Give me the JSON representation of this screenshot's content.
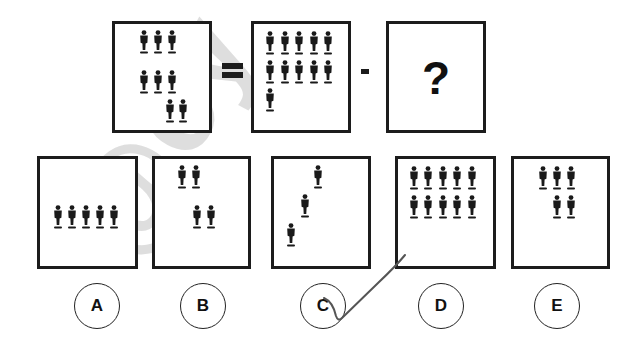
{
  "puzzle": {
    "equation": {
      "left_box": {
        "figure_count": 8,
        "rows": [
          3,
          3,
          2
        ]
      },
      "equals_sign": "=",
      "middle_box": {
        "figure_count": 11,
        "rows": [
          5,
          5,
          1
        ]
      },
      "minus_sign": "-",
      "unknown_box": {
        "label": "?"
      }
    },
    "options": [
      {
        "label": "A",
        "figure_count": 5,
        "layout": "single row of 5"
      },
      {
        "label": "B",
        "figure_count": 4,
        "layout": "2 top-left, 2 lower-right"
      },
      {
        "label": "C",
        "figure_count": 3,
        "layout": "diagonal staircase"
      },
      {
        "label": "D",
        "figure_count": 10,
        "layout": "two rows of 5"
      },
      {
        "label": "E",
        "figure_count": 5,
        "layout": "row of 3 above row of 2"
      }
    ],
    "marked_answer": "C"
  },
  "colors": {
    "ink": "#1c1c1c",
    "background": "#ffffff",
    "pen_stroke": "#555555",
    "watermark": "#c8c8c8"
  }
}
